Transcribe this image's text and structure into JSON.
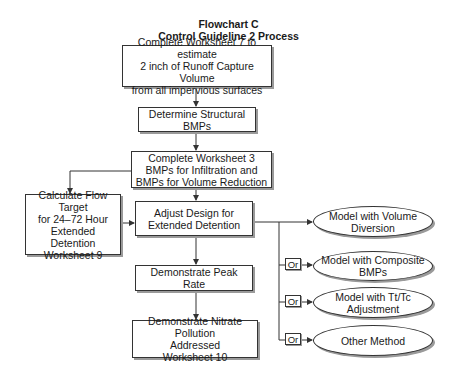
{
  "title": {
    "line1": "Flowchart C",
    "line2": "Control Guideline 2 Process"
  },
  "nodes": {
    "worksheet7": "Complete Worksheet 7 to estimate\n2 inch of Runoff Capture Volume\nfrom all impervious surfaces",
    "structural_bmps": "Determine Structural\nBMPs",
    "worksheet3": "Complete Worksheet 3\nBMPs for Infiltration and\nBMPs for Volume Reduction",
    "flow_target": "Calculate Flow Target\nfor 24–72 Hour\nExtended\nDetention\nWorksheet 9",
    "adjust_design": "Adjust Design for\nExtended Detention",
    "peak_rate": "Demonstrate Peak Rate",
    "nitrate": "Demonstrate Nitrate Pollution\nAddressed\nWorksheet 10"
  },
  "options": [
    {
      "label": "Model with Volume\nDiversion",
      "connector": ""
    },
    {
      "label": "Model with Composite\nBMPs",
      "connector": "Or"
    },
    {
      "label": "Model with Tt/Tc\nAdjustment",
      "connector": "Or"
    },
    {
      "label": "Other Method",
      "connector": "Or"
    }
  ],
  "colors": {
    "line": "#333333",
    "shadow": "#9a9a9a",
    "background": "#ffffff"
  }
}
